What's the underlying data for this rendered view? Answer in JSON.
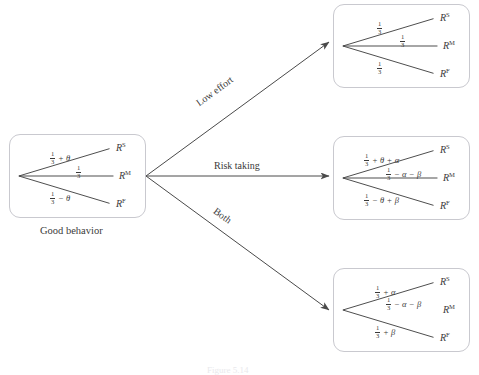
{
  "figure": {
    "caption": "Figure 5.14",
    "source_caption": "Good behavior"
  },
  "outcomes": {
    "success": "R",
    "success_sup": "S",
    "medium": "R",
    "medium_sup": "M",
    "failure": "R",
    "failure_sup": "F"
  },
  "edges": [
    {
      "id": "low-effort",
      "label": "Low effort"
    },
    {
      "id": "risk-taking",
      "label": "Risk taking"
    },
    {
      "id": "both",
      "label": "Both"
    }
  ],
  "nodes": [
    {
      "id": "good-behavior",
      "caption": "Good behavior",
      "probabilities": {
        "top": {
          "num": "1",
          "den": "3",
          "tail": " + θ"
        },
        "mid": {
          "num": "1",
          "den": "3",
          "tail": ""
        },
        "bot": {
          "num": "1",
          "den": "3",
          "tail": " − θ"
        }
      },
      "highlight_mid": false
    },
    {
      "id": "low-effort-outcome",
      "caption": "",
      "probabilities": {
        "top": {
          "num": "1",
          "den": "3",
          "tail": ""
        },
        "mid": {
          "num": "1",
          "den": "3",
          "tail": ""
        },
        "bot": {
          "num": "1",
          "den": "3",
          "tail": ""
        }
      },
      "highlight_mid": false
    },
    {
      "id": "risk-taking-outcome",
      "caption": "",
      "probabilities": {
        "top": {
          "num": "1",
          "den": "3",
          "tail": " + θ + α"
        },
        "mid": {
          "num": "1",
          "den": "3",
          "tail": " − α − β"
        },
        "bot": {
          "num": "1",
          "den": "3",
          "tail": " − θ + β"
        }
      },
      "highlight_mid": false
    },
    {
      "id": "both-outcome",
      "caption": "",
      "probabilities": {
        "top": {
          "num": "1",
          "den": "3",
          "tail": " + α"
        },
        "mid": {
          "num": "1",
          "den": "3",
          "tail": " − α − β"
        },
        "bot": {
          "num": "1",
          "den": "3",
          "tail": " + β"
        }
      },
      "highlight_mid": true
    }
  ],
  "colors": {
    "box_border": "#c9c9cf",
    "ray": "#4a4a4a",
    "text": "#3a3a3a",
    "highlight_green": "#3fbf6f",
    "highlight_red": "#e8476f",
    "background": "#ffffff"
  }
}
